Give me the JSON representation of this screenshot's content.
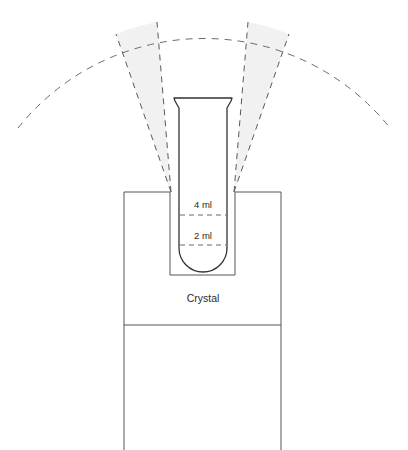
{
  "diagram": {
    "labels": {
      "upper_graduation": "4 ml",
      "lower_graduation": "2 ml",
      "crystal": "Crystal"
    },
    "colors": {
      "background": "#ffffff",
      "solid_stroke": "#555555",
      "tube_stroke": "#333333",
      "dashed_stroke": "#5a5a5a",
      "arc_stroke": "#6b6b6b",
      "wedge_fill": "#f1f1f1",
      "text": "#2b2b2b"
    },
    "geometry": {
      "canvas_width": 408,
      "canvas_height": 450,
      "crystal_block": {
        "left": 124,
        "right": 281,
        "top": 192,
        "divider_y": 325,
        "bottom": 450
      },
      "well": {
        "left": 170,
        "right": 235,
        "top": 192,
        "bottom": 275
      },
      "tube": {
        "rim_left": 174,
        "rim_right": 232,
        "rim_top": 98,
        "body_left": 179,
        "body_right": 227,
        "shoulder_y": 108,
        "bottom_y": 272,
        "bulb_radius": 24
      },
      "graduations": {
        "four_ml_y": 215,
        "two_ml_y": 245
      },
      "cone": {
        "apex_left_x": 171,
        "apex_right_x": 234,
        "apex_y": 192,
        "arc_peak_y": 20,
        "arc_left_end_x": 18,
        "arc_right_end_x": 390,
        "arc_end_y": 128
      }
    }
  }
}
